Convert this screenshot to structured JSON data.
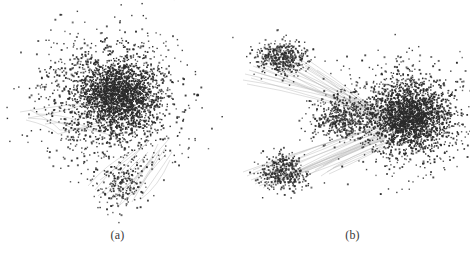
{
  "figure": {
    "background_color": "#ffffff",
    "node_color": "#2b2b2b",
    "edge_color": "#b9b9b9",
    "width": 470,
    "height": 258
  },
  "panels": [
    {
      "id": "a",
      "caption": "(a)",
      "description": "single dense network cluster",
      "node_count": 3200,
      "edge_count": 26
    },
    {
      "id": "b",
      "caption": "(b)",
      "description": "network with one large cluster and two smaller satellite clusters connected by edge bundles",
      "node_count": 3400,
      "edge_count": 46
    }
  ],
  "chart_data": {
    "type": "scatter",
    "title": "",
    "xlabel": "",
    "ylabel": "",
    "grid": false,
    "legend": null,
    "axes_visible": false,
    "panels": [
      {
        "label": "(a)",
        "type": "node-link-graph",
        "clusters": [
          {
            "name": "core",
            "cx": 118,
            "cy": 95,
            "rx": 46,
            "ry": 42,
            "node_count": 1500,
            "density": "very-high"
          },
          {
            "name": "halo",
            "cx": 112,
            "cy": 100,
            "rx": 88,
            "ry": 80,
            "node_count": 1500,
            "density": "medium"
          },
          {
            "name": "lower-tail",
            "cx": 122,
            "cy": 185,
            "rx": 34,
            "ry": 28,
            "node_count": 200,
            "density": "low"
          }
        ],
        "edges": [
          [
            28,
            118,
            96,
            100
          ],
          [
            28,
            118,
            72,
            128
          ],
          [
            72,
            128,
            118,
            138
          ],
          [
            20,
            112,
            96,
            102
          ],
          [
            30,
            110,
            60,
            130
          ],
          [
            60,
            130,
            105,
            120
          ],
          [
            95,
            190,
            135,
            150
          ],
          [
            110,
            200,
            150,
            160
          ],
          [
            120,
            205,
            160,
            150
          ],
          [
            128,
            196,
            168,
            140
          ],
          [
            140,
            200,
            170,
            160
          ],
          [
            100,
            180,
            145,
            145
          ],
          [
            26,
            120,
            58,
            134
          ],
          [
            58,
            134,
            100,
            125
          ],
          [
            115,
            198,
            155,
            155
          ],
          [
            132,
            202,
            165,
            148
          ],
          [
            88,
            186,
            130,
            152
          ],
          [
            105,
            195,
            148,
            152
          ],
          [
            36,
            114,
            80,
            122
          ],
          [
            125,
            190,
            158,
            144
          ],
          [
            118,
            208,
            152,
            162
          ],
          [
            98,
            196,
            140,
            158
          ],
          [
            142,
            196,
            172,
            152
          ],
          [
            45,
            124,
            92,
            128
          ],
          [
            112,
            186,
            150,
            140
          ],
          [
            135,
            194,
            166,
            154
          ]
        ],
        "xlim": [
          0,
          235
        ],
        "ylim": [
          0,
          225
        ]
      },
      {
        "label": "(b)",
        "type": "node-link-graph",
        "clusters": [
          {
            "name": "main-core",
            "cx": 175,
            "cy": 118,
            "rx": 44,
            "ry": 40,
            "node_count": 1400,
            "density": "very-high"
          },
          {
            "name": "main-halo",
            "cx": 172,
            "cy": 115,
            "rx": 72,
            "ry": 64,
            "node_count": 1100,
            "density": "medium"
          },
          {
            "name": "upper-left-satellite",
            "cx": 48,
            "cy": 58,
            "rx": 32,
            "ry": 22,
            "node_count": 420,
            "density": "high"
          },
          {
            "name": "lower-left-satellite",
            "cx": 48,
            "cy": 172,
            "rx": 30,
            "ry": 22,
            "node_count": 380,
            "density": "high"
          },
          {
            "name": "bridge",
            "cx": 108,
            "cy": 118,
            "rx": 42,
            "ry": 30,
            "node_count": 500,
            "density": "medium"
          }
        ],
        "edges": [
          [
            8,
            80,
            150,
            112
          ],
          [
            10,
            74,
            152,
            110
          ],
          [
            14,
            70,
            150,
            114
          ],
          [
            18,
            66,
            148,
            116
          ],
          [
            22,
            62,
            146,
            112
          ],
          [
            26,
            58,
            150,
            108
          ],
          [
            30,
            56,
            152,
            114
          ],
          [
            34,
            54,
            148,
            118
          ],
          [
            20,
            72,
            146,
            118
          ],
          [
            16,
            78,
            152,
            116
          ],
          [
            12,
            84,
            148,
            120
          ],
          [
            24,
            66,
            150,
            120
          ],
          [
            8,
            172,
            150,
            126
          ],
          [
            12,
            176,
            152,
            124
          ],
          [
            16,
            180,
            150,
            130
          ],
          [
            20,
            184,
            148,
            128
          ],
          [
            24,
            186,
            150,
            132
          ],
          [
            28,
            188,
            152,
            128
          ],
          [
            32,
            186,
            148,
            134
          ],
          [
            36,
            184,
            150,
            136
          ],
          [
            40,
            182,
            152,
            130
          ],
          [
            26,
            178,
            148,
            124
          ],
          [
            22,
            174,
            150,
            122
          ],
          [
            18,
            170,
            152,
            126
          ],
          [
            44,
            180,
            150,
            138
          ],
          [
            48,
            178,
            148,
            132
          ],
          [
            52,
            176,
            152,
            134
          ],
          [
            40,
            64,
            150,
            122
          ],
          [
            44,
            60,
            152,
            118
          ],
          [
            48,
            58,
            148,
            124
          ],
          [
            56,
            56,
            150,
            116
          ],
          [
            60,
            62,
            152,
            122
          ],
          [
            64,
            58,
            148,
            126
          ],
          [
            70,
            66,
            150,
            124
          ],
          [
            76,
            62,
            152,
            120
          ],
          [
            82,
            70,
            148,
            122
          ],
          [
            56,
            174,
            150,
            140
          ],
          [
            62,
            172,
            152,
            136
          ],
          [
            68,
            178,
            148,
            140
          ],
          [
            74,
            174,
            150,
            142
          ],
          [
            80,
            170,
            152,
            138
          ],
          [
            86,
            176,
            148,
            144
          ],
          [
            92,
            172,
            150,
            146
          ],
          [
            98,
            168,
            152,
            142
          ],
          [
            88,
            166,
            150,
            138
          ],
          [
            94,
            174,
            148,
            148
          ]
        ],
        "xlim": [
          0,
          235
        ],
        "ylim": [
          0,
          225
        ]
      }
    ]
  }
}
